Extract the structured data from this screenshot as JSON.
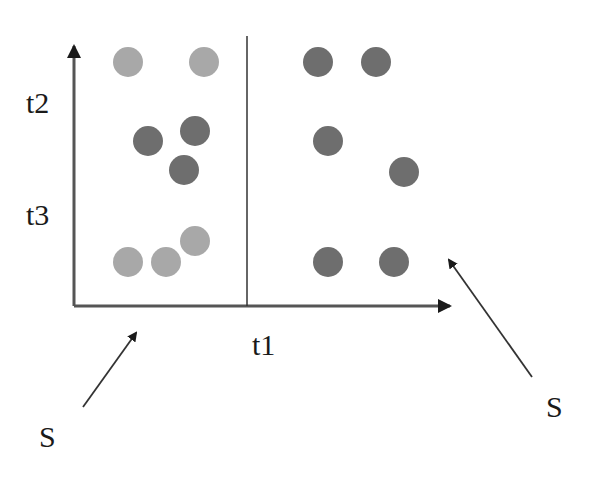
{
  "diagram": {
    "axis_labels": {
      "x_divider": "t1",
      "y_upper": "t2",
      "y_lower": "t3"
    },
    "annotations": [
      {
        "label": "S",
        "position": "bottom-left"
      },
      {
        "label": "S",
        "position": "bottom-right"
      }
    ],
    "colors": {
      "light_dot": "#a8a8a8",
      "dark_dot": "#6e6e6e",
      "axis": "#555555",
      "text": "#1a1a1a"
    },
    "dots": [
      {
        "cx": 128,
        "cy": 62,
        "shade": "light"
      },
      {
        "cx": 204,
        "cy": 62,
        "shade": "light"
      },
      {
        "cx": 148,
        "cy": 141,
        "shade": "dark"
      },
      {
        "cx": 195,
        "cy": 131,
        "shade": "dark"
      },
      {
        "cx": 184,
        "cy": 170,
        "shade": "dark"
      },
      {
        "cx": 128,
        "cy": 262,
        "shade": "light"
      },
      {
        "cx": 166,
        "cy": 262,
        "shade": "light"
      },
      {
        "cx": 195,
        "cy": 241,
        "shade": "light"
      },
      {
        "cx": 318,
        "cy": 62,
        "shade": "dark"
      },
      {
        "cx": 376,
        "cy": 62,
        "shade": "dark"
      },
      {
        "cx": 328,
        "cy": 141,
        "shade": "dark"
      },
      {
        "cx": 404,
        "cy": 172,
        "shade": "dark"
      },
      {
        "cx": 328,
        "cy": 262,
        "shade": "dark"
      },
      {
        "cx": 394,
        "cy": 262,
        "shade": "dark"
      }
    ]
  }
}
